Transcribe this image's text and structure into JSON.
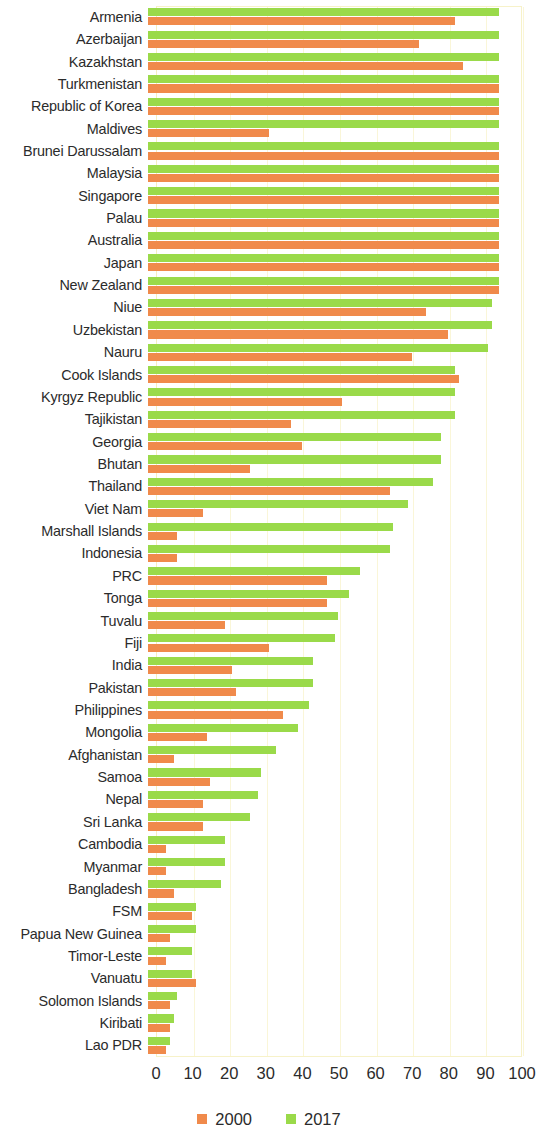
{
  "chart_data": {
    "type": "bar",
    "orientation": "horizontal",
    "title": "",
    "subtitle": "",
    "xlabel": "",
    "ylabel": "",
    "xlim": [
      0,
      100
    ],
    "xticks": [
      0,
      10,
      20,
      30,
      40,
      50,
      60,
      70,
      80,
      90,
      100
    ],
    "xtick_labels": [
      "0",
      "10",
      "20",
      "30",
      "40",
      "50",
      "60",
      "70",
      "80",
      "90",
      "100"
    ],
    "grid": true,
    "grid_axis": "x",
    "legend_position": "bottom",
    "categories": [
      "Armenia",
      "Azerbaijan",
      "Kazakhstan",
      "Turkmenistan",
      "Republic of Korea",
      "Maldives",
      "Brunei Darussalam",
      "Malaysia",
      "Singapore",
      "Palau",
      "Australia",
      "Japan",
      "New Zealand",
      "Niue",
      "Uzbekistan",
      "Nauru",
      "Cook Islands",
      "Kyrgyz Republic",
      "Tajikistan",
      "Georgia",
      "Bhutan",
      "Thailand",
      "Viet Nam",
      "Marshall Islands",
      "Indonesia",
      "PRC",
      "Tonga",
      "Tuvalu",
      "Fiji",
      "India",
      "Pakistan",
      "Philippines",
      "Mongolia",
      "Afghanistan",
      "Samoa",
      "Nepal",
      "Sri Lanka",
      "Cambodia",
      "Myanmar",
      "Bangladesh",
      "FSM",
      "Papua New Guinea",
      "Timor-Leste",
      "Vanuatu",
      "Solomon Islands",
      "Kiribati",
      "Lao PDR"
    ],
    "series": [
      {
        "name": "2000",
        "color": "#f08a4b",
        "values": [
          84,
          74,
          86,
          96,
          96,
          33,
          96,
          96,
          96,
          96,
          96,
          96,
          96,
          76,
          82,
          72,
          85,
          53,
          39,
          42,
          28,
          66,
          15,
          8,
          8,
          49,
          49,
          21,
          33,
          23,
          24,
          37,
          16,
          7,
          17,
          15,
          15,
          5,
          5,
          7,
          12,
          6,
          5,
          13,
          6,
          6,
          5
        ]
      },
      {
        "name": "2017",
        "color": "#9ada4a",
        "values": [
          96,
          96,
          96,
          96,
          96,
          96,
          96,
          96,
          96,
          96,
          96,
          96,
          96,
          94,
          94,
          93,
          84,
          84,
          84,
          80,
          80,
          78,
          71,
          67,
          66,
          58,
          55,
          52,
          51,
          45,
          45,
          44,
          41,
          35,
          31,
          30,
          28,
          21,
          21,
          20,
          13,
          13,
          12,
          12,
          8,
          7,
          6
        ]
      }
    ],
    "legend": [
      {
        "label": "2000",
        "color": "#f08a4b"
      },
      {
        "label": "2017",
        "color": "#9ada4a"
      }
    ]
  }
}
